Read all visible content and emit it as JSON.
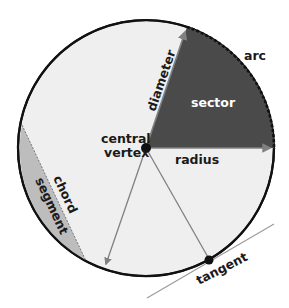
{
  "diagram": {
    "colors": {
      "background": "#ffffff",
      "circle_fill": "#efefef",
      "circle_stroke": "#111111",
      "sector_fill": "#4a4a4a",
      "segment_fill": "#bdbdbd",
      "arrow_color": "#808080",
      "vertex_color": "#111111",
      "label_dark": "#1a1a1a",
      "label_light": "#ffffff",
      "tangent_line": "#9a9a9a"
    },
    "labels": {
      "arc": "arc",
      "sector": "sector",
      "diameter": "diameter",
      "central_vertex_line1": "central",
      "central_vertex_line2": "vertex",
      "radius": "radius",
      "chord": "chord",
      "segment": "segment",
      "tangent": "tangent"
    }
  }
}
